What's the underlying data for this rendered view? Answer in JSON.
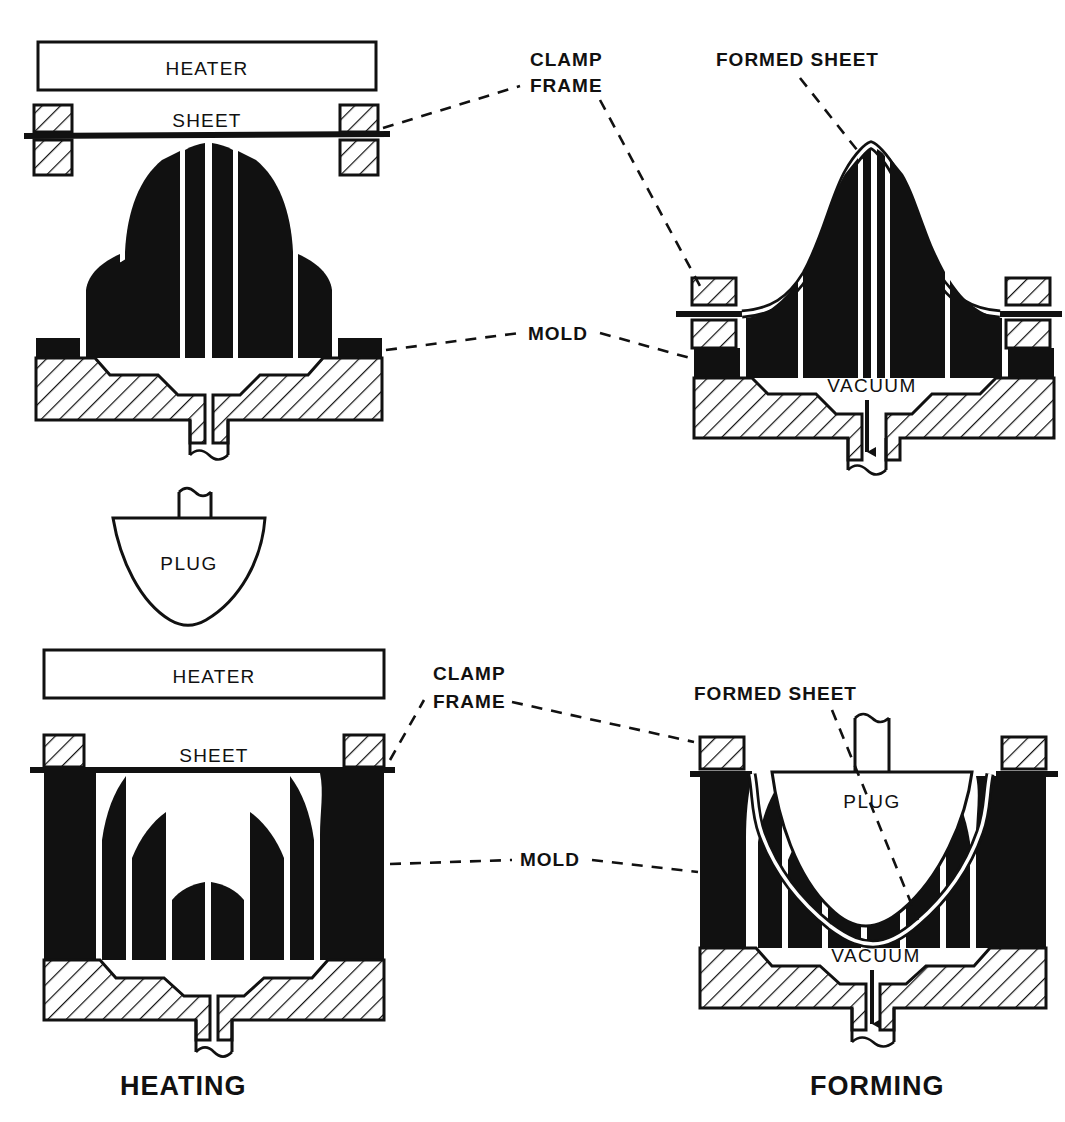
{
  "figure": {
    "kind": "technical-cross-section-diagram"
  },
  "labels": {
    "heater_top": "HEATER",
    "sheet_top": "SHEET",
    "clamp_frame_top_line1": "CLAMP",
    "clamp_frame_top_line2": "FRAME",
    "formed_sheet_top": "FORMED SHEET",
    "mold_top": "MOLD",
    "vacuum_top": "VACUUM",
    "plug_center": "PLUG",
    "heater_bottom": "HEATER",
    "sheet_bottom": "SHEET",
    "clamp_frame_bottom_line1": "CLAMP",
    "clamp_frame_bottom_line2": "FRAME",
    "formed_sheet_bottom": "FORMED SHEET",
    "mold_bottom": "MOLD",
    "vacuum_bottom": "VACUUM",
    "plug_bottom": "PLUG"
  },
  "stage_titles": {
    "left": "HEATING",
    "right": "FORMING"
  },
  "colors": {
    "ink": "#111111",
    "paper": "#ffffff",
    "solid_fill": "#111111"
  },
  "panels": [
    {
      "id": "top-left",
      "stage": "HEATING",
      "mold_type": "male",
      "parts": [
        "heater",
        "sheet",
        "clamp-frame",
        "mold",
        "vacuum-pipe"
      ]
    },
    {
      "id": "top-right",
      "stage": "FORMING",
      "mold_type": "male",
      "parts": [
        "formed-sheet",
        "clamp-frame",
        "mold",
        "vacuum",
        "vacuum-pipe"
      ]
    },
    {
      "id": "bottom-left",
      "stage": "HEATING",
      "mold_type": "female",
      "parts": [
        "heater",
        "sheet",
        "clamp-frame",
        "mold",
        "vacuum-pipe"
      ]
    },
    {
      "id": "bottom-right",
      "stage": "FORMING",
      "mold_type": "female",
      "parts": [
        "plug",
        "formed-sheet",
        "clamp-frame",
        "mold",
        "vacuum",
        "vacuum-pipe"
      ]
    }
  ]
}
